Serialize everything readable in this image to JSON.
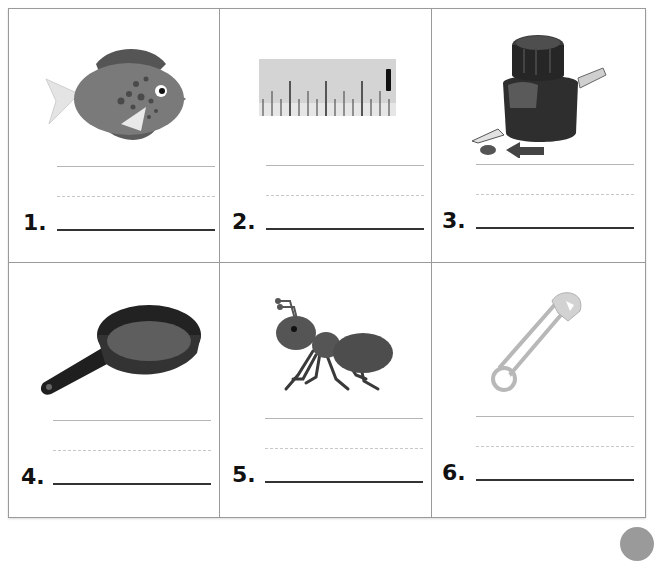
{
  "worksheet": {
    "items": [
      {
        "number": "1.",
        "picture": "fish",
        "answer": ""
      },
      {
        "number": "2.",
        "picture": "ruler",
        "answer": ""
      },
      {
        "number": "3.",
        "picture": "ink-bottle-and-pen",
        "answer": ""
      },
      {
        "number": "4.",
        "picture": "frying-pan",
        "answer": ""
      },
      {
        "number": "5.",
        "picture": "ant",
        "answer": ""
      },
      {
        "number": "6.",
        "picture": "safety-pin",
        "answer": ""
      }
    ]
  },
  "colors": {
    "border": "#9a9a9a",
    "guide_line": "#b5b5b5",
    "dashed_line": "#c8c8c8",
    "baseline": "#333333",
    "text": "#111111"
  }
}
